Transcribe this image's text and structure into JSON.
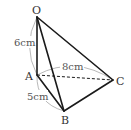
{
  "figure": {
    "type": "triangular-pyramid",
    "vertices": {
      "O": "O",
      "A": "A",
      "B": "B",
      "C": "C"
    },
    "measurements": {
      "OA": "6cm",
      "AC": "8cm",
      "AB": "5cm"
    },
    "edges": [
      {
        "from": "O",
        "to": "A",
        "style": "solid"
      },
      {
        "from": "O",
        "to": "B",
        "style": "solid"
      },
      {
        "from": "O",
        "to": "C",
        "style": "solid"
      },
      {
        "from": "A",
        "to": "B",
        "style": "solid"
      },
      {
        "from": "B",
        "to": "C",
        "style": "solid"
      },
      {
        "from": "A",
        "to": "C",
        "style": "dashed"
      }
    ],
    "colors": {
      "edge": "#1a1a1a",
      "dimension_arc": "#9a9a9a",
      "label": "#333333"
    }
  }
}
